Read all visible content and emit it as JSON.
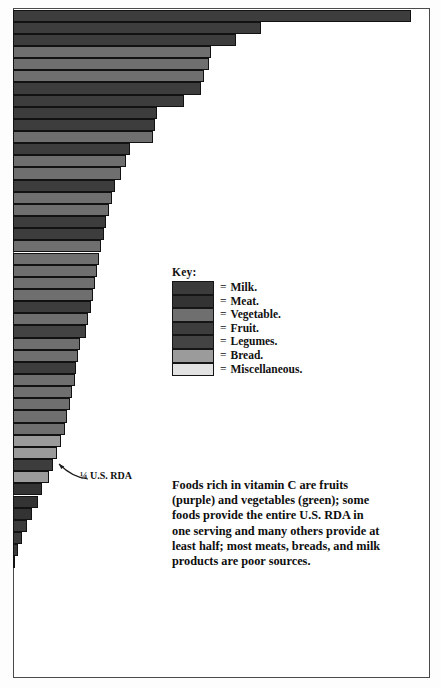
{
  "figure": {
    "frame_color": "#4a4a4a",
    "background": "#ffffff"
  },
  "legend": {
    "title": "Key:",
    "equals_sign": "=",
    "items": [
      {
        "label": "Milk.",
        "color": "#3b3b3b"
      },
      {
        "label": "Meat.",
        "color": "#333333"
      },
      {
        "label": "Vegetable.",
        "color": "#6f6f6f"
      },
      {
        "label": "Fruit.",
        "color": "#3d3d3d"
      },
      {
        "label": "Legumes.",
        "color": "#434343"
      },
      {
        "label": "Bread.",
        "color": "#9b9b9b"
      },
      {
        "label": "Miscellaneous.",
        "color": "#e2e2e2"
      }
    ]
  },
  "annotation": {
    "label": "¼ U.S. RDA"
  },
  "caption": {
    "text": "Foods rich in vitamin C are fruits (purple) and vegetables (green); some foods provide the entire U.S. RDA in one serving and many others provide at least half; most meats, breads, and milk products are poor sources."
  },
  "chart_data": {
    "type": "bar",
    "orientation": "horizontal",
    "title": "",
    "xlabel": "",
    "ylabel": "",
    "grid": false,
    "legend_position": "center",
    "note": "Bar length encodes vitamin C content per serving; bars sorted descending. Category = food group color from Key. Value is percent of plot width (0-100).",
    "categories_legend": [
      "Milk.",
      "Meat.",
      "Vegetable.",
      "Fruit.",
      "Legumes.",
      "Bread.",
      "Miscellaneous."
    ],
    "colors": {
      "Milk.": "#3b3b3b",
      "Meat.": "#333333",
      "Vegetable.": "#6f6f6f",
      "Fruit.": "#3d3d3d",
      "Legumes.": "#434343",
      "Bread.": "#9b9b9b",
      "Miscellaneous.": "#e2e2e2"
    },
    "reference_lines": [
      {
        "label": "¼ U.S. RDA",
        "value": 20.0
      }
    ],
    "bars": [
      {
        "value": 95.5,
        "group": "Fruit."
      },
      {
        "value": 59.5,
        "group": "Fruit."
      },
      {
        "value": 53.5,
        "group": "Fruit."
      },
      {
        "value": 47.5,
        "group": "Vegetable."
      },
      {
        "value": 47.0,
        "group": "Vegetable."
      },
      {
        "value": 45.8,
        "group": "Vegetable."
      },
      {
        "value": 45.0,
        "group": "Fruit."
      },
      {
        "value": 41.0,
        "group": "Fruit."
      },
      {
        "value": 34.5,
        "group": "Fruit."
      },
      {
        "value": 34.0,
        "group": "Fruit."
      },
      {
        "value": 33.5,
        "group": "Vegetable."
      },
      {
        "value": 28.0,
        "group": "Fruit."
      },
      {
        "value": 27.0,
        "group": "Vegetable."
      },
      {
        "value": 26.0,
        "group": "Vegetable."
      },
      {
        "value": 24.5,
        "group": "Fruit."
      },
      {
        "value": 23.8,
        "group": "Vegetable."
      },
      {
        "value": 23.0,
        "group": "Vegetable."
      },
      {
        "value": 22.4,
        "group": "Fruit."
      },
      {
        "value": 21.8,
        "group": "Fruit."
      },
      {
        "value": 21.0,
        "group": "Vegetable."
      },
      {
        "value": 20.6,
        "group": "Vegetable."
      },
      {
        "value": 20.2,
        "group": "Vegetable."
      },
      {
        "value": 19.6,
        "group": "Vegetable."
      },
      {
        "value": 19.2,
        "group": "Vegetable."
      },
      {
        "value": 18.6,
        "group": "Fruit."
      },
      {
        "value": 18.0,
        "group": "Vegetable."
      },
      {
        "value": 17.4,
        "group": "Legumes."
      },
      {
        "value": 16.0,
        "group": "Vegetable."
      },
      {
        "value": 15.6,
        "group": "Vegetable."
      },
      {
        "value": 15.2,
        "group": "Fruit."
      },
      {
        "value": 14.8,
        "group": "Vegetable."
      },
      {
        "value": 14.2,
        "group": "Vegetable."
      },
      {
        "value": 13.6,
        "group": "Vegetable."
      },
      {
        "value": 13.0,
        "group": "Vegetable."
      },
      {
        "value": 12.4,
        "group": "Vegetable."
      },
      {
        "value": 11.4,
        "group": "Bread."
      },
      {
        "value": 10.6,
        "group": "Bread."
      },
      {
        "value": 9.6,
        "group": "Fruit."
      },
      {
        "value": 8.6,
        "group": "Bread."
      },
      {
        "value": 7.0,
        "group": "Meat."
      },
      {
        "value": 6.0,
        "group": "Meat."
      },
      {
        "value": 4.6,
        "group": "Meat."
      },
      {
        "value": 3.4,
        "group": "Milk."
      },
      {
        "value": 2.2,
        "group": "Milk."
      },
      {
        "value": 1.2,
        "group": "Milk."
      },
      {
        "value": 0.4,
        "group": "Miscellaneous."
      }
    ]
  }
}
